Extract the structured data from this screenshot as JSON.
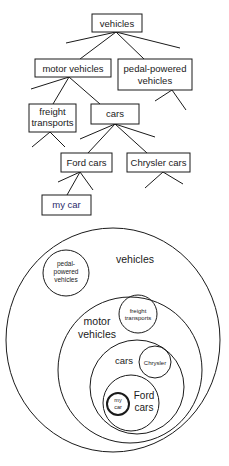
{
  "tree": {
    "nodes": [
      {
        "id": "vehicles",
        "lines": [
          "vehicles"
        ]
      },
      {
        "id": "motor-vehicles",
        "lines": [
          "motor vehicles"
        ]
      },
      {
        "id": "pedal-powered-vehicles",
        "lines": [
          "pedal-powered",
          "vehicles"
        ]
      },
      {
        "id": "freight-transports",
        "lines": [
          "freight",
          "transports"
        ]
      },
      {
        "id": "cars",
        "lines": [
          "cars"
        ]
      },
      {
        "id": "ford-cars",
        "lines": [
          "Ford cars"
        ]
      },
      {
        "id": "chrysler-cars",
        "lines": [
          "Chrysler cars"
        ]
      },
      {
        "id": "my-car",
        "lines": [
          "my car"
        ]
      }
    ],
    "edges": [
      [
        "vehicles",
        "motor-vehicles"
      ],
      [
        "vehicles",
        "pedal-powered-vehicles"
      ],
      [
        "motor-vehicles",
        "freight-transports"
      ],
      [
        "motor-vehicles",
        "cars"
      ],
      [
        "cars",
        "ford-cars"
      ],
      [
        "cars",
        "chrysler-cars"
      ],
      [
        "ford-cars",
        "my-car"
      ]
    ]
  },
  "venn": {
    "sets": [
      {
        "id": "vehicles",
        "lines": [
          "vehicles"
        ]
      },
      {
        "id": "pedal-powered-vehicles",
        "lines": [
          "pedal-",
          "powered",
          "vehicles"
        ]
      },
      {
        "id": "motor-vehicles",
        "lines": [
          "motor",
          "vehicles"
        ]
      },
      {
        "id": "freight-transports",
        "lines": [
          "freight",
          "transports"
        ]
      },
      {
        "id": "cars",
        "lines": [
          "cars"
        ]
      },
      {
        "id": "chrysler",
        "lines": [
          "Chrysler"
        ]
      },
      {
        "id": "ford-cars",
        "lines": [
          "Ford",
          "cars"
        ]
      },
      {
        "id": "my-car",
        "lines": [
          "my",
          "car"
        ]
      }
    ]
  },
  "colors": {
    "stroke": "#1a1a1a",
    "background": "#ffffff",
    "my_car_text": "#2a2a6a"
  }
}
